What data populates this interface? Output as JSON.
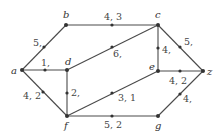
{
  "diagram": {
    "type": "flow-network",
    "vertices": [
      {
        "id": "a",
        "label": "a",
        "x": 22,
        "y": 70,
        "lx": 11,
        "ly": 74
      },
      {
        "id": "b",
        "label": "b",
        "x": 66,
        "y": 25,
        "lx": 63,
        "ly": 18
      },
      {
        "id": "c",
        "label": "c",
        "x": 158,
        "y": 25,
        "lx": 155,
        "ly": 18
      },
      {
        "id": "d",
        "label": "d",
        "x": 67,
        "y": 70,
        "lx": 65,
        "ly": 65
      },
      {
        "id": "e",
        "label": "e",
        "x": 158,
        "y": 71,
        "lx": 149,
        "ly": 70
      },
      {
        "id": "z",
        "label": "z",
        "x": 203,
        "y": 71,
        "lx": 207,
        "ly": 75
      },
      {
        "id": "f",
        "label": "f",
        "x": 67,
        "y": 116,
        "lx": 64,
        "ly": 129
      },
      {
        "id": "g",
        "label": "g",
        "x": 158,
        "y": 116,
        "lx": 155,
        "ly": 129
      }
    ],
    "edges": [
      {
        "from": "a",
        "to": "b",
        "label": "5,",
        "mx": 44,
        "my": 47,
        "lx": 33,
        "ly": 46
      },
      {
        "from": "a",
        "to": "d",
        "label": "1,",
        "mx": 45,
        "my": 70,
        "lx": 41,
        "ly": 66
      },
      {
        "from": "a",
        "to": "f",
        "label": "4, 2",
        "mx": 43,
        "my": 92,
        "lx": 23,
        "ly": 99
      },
      {
        "from": "b",
        "to": "c",
        "label": "4, 3",
        "mx": 112,
        "my": 25,
        "lx": 104,
        "ly": 20
      },
      {
        "from": "d",
        "to": "c",
        "label": "6,",
        "mx": 112,
        "my": 47,
        "lx": 113,
        "ly": 57
      },
      {
        "from": "d",
        "to": "f",
        "label": "2,",
        "mx": 67,
        "my": 93,
        "lx": 71,
        "ly": 96
      },
      {
        "from": "c",
        "to": "e",
        "label": "4,",
        "mx": 158,
        "my": 48,
        "lx": 162,
        "ly": 53
      },
      {
        "from": "c",
        "to": "z",
        "label": "5,",
        "mx": 180,
        "my": 47,
        "lx": 184,
        "ly": 45
      },
      {
        "from": "e",
        "to": "z",
        "label": "4, 2",
        "mx": 180,
        "my": 71,
        "lx": 169,
        "ly": 84
      },
      {
        "from": "f",
        "to": "e",
        "label": "3, 1",
        "mx": 112,
        "my": 93,
        "lx": 118,
        "ly": 101
      },
      {
        "from": "f",
        "to": "g",
        "label": "5, 2",
        "mx": 112,
        "my": 116,
        "lx": 104,
        "ly": 128
      },
      {
        "from": "g",
        "to": "z",
        "label": "4,",
        "mx": 180,
        "my": 94,
        "lx": 183,
        "ly": 102
      }
    ]
  }
}
